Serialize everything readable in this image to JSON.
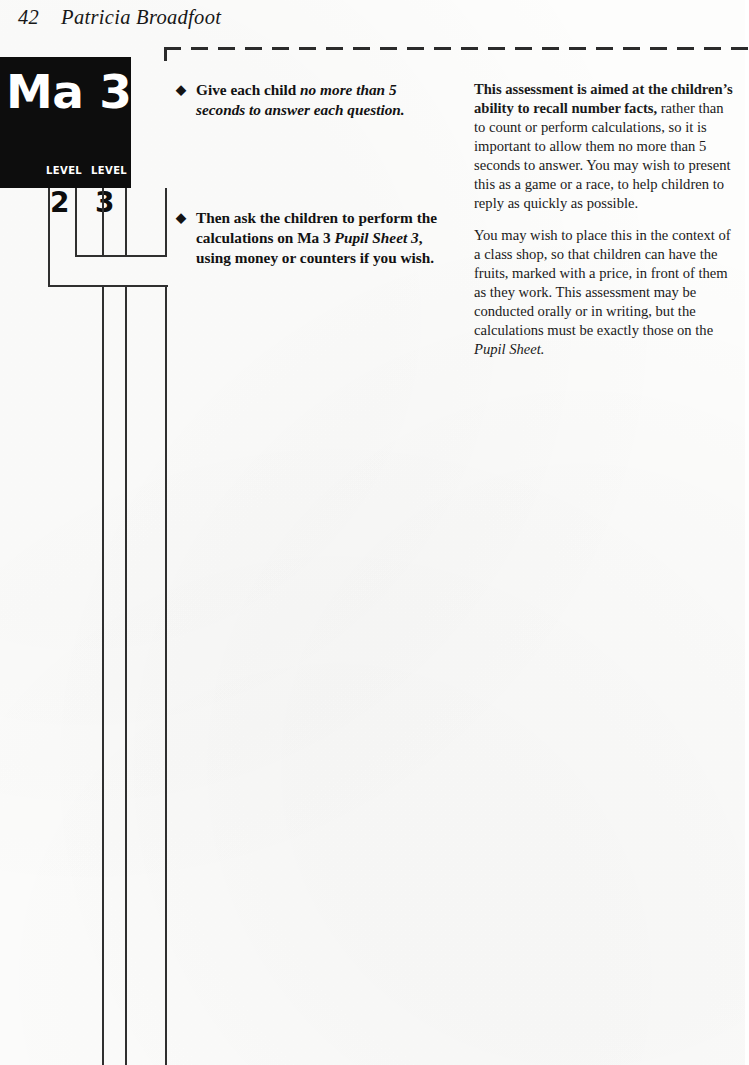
{
  "header": {
    "folio": "42",
    "author": "Patricia Broadfoot"
  },
  "logo": {
    "title": "Ma 3",
    "level_label_left": "LEVEL",
    "level_label_right": "LEVEL",
    "level_number_left": "2",
    "level_number_right": "3",
    "background_color": "#0d0d0d",
    "text_color": "#ffffff"
  },
  "bullets": [
    {
      "marker": "◆",
      "lead": "Give each child ",
      "emphasis": "no more than 5 seconds to answer each question.",
      "tail": ""
    },
    {
      "marker": "◆",
      "lead": "Then ask the children to perform the calculations on Ma 3 ",
      "emphasis": "Pupil Sheet 3",
      "tail": ", using money or counters if you wish."
    }
  ],
  "commentary": [
    {
      "bold_lead": "This assessment is aimed at the children’s ability to recall number facts,",
      "body": " rather than to count or perform calculations, so it is important to allow them no more than 5 seconds to answer. You may wish to present this as a game or a race, to help children to reply as quickly as possible.",
      "italic_tail": ""
    },
    {
      "bold_lead": "",
      "body": "You may wish to place this in the context of a class shop, so that children can have the fruits, marked with a price, in front of them as they work. This assessment may be conducted orally or in writing, but the calculations must be exactly those on the ",
      "italic_tail": "Pupil Sheet."
    }
  ],
  "rules": {
    "dashed_top_rule": "dashed-horizontal-rule",
    "line_color": "#2f2f2f"
  }
}
